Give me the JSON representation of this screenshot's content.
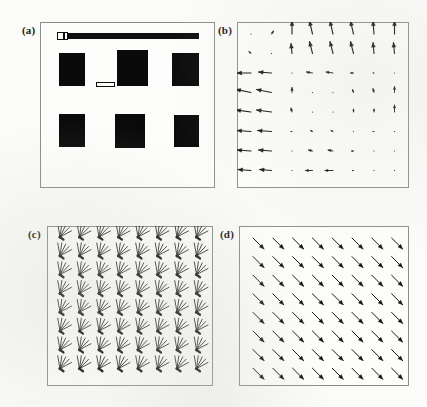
{
  "figure": {
    "width": 427,
    "height": 407,
    "background": "#fbfbf9",
    "ink_color": "#141414",
    "frame_color": "#8d8d8a"
  },
  "panels": [
    {
      "id": "a",
      "label": "(a)",
      "kind": "image",
      "caption_position": "top-left-outside",
      "frame": {
        "x": 40,
        "y": 22,
        "w": 175,
        "h": 166
      },
      "label_pos": {
        "x": 22,
        "y": 24
      },
      "content": {
        "description": "binary image of six dark rectangles in a 2x3 arrangement with a horizontal bar across the top",
        "top_bar": {
          "x": 17,
          "y": 11,
          "w": 142,
          "h": 6,
          "color": "#0f0f0f"
        },
        "top_bar_cap": {
          "x": 17,
          "y": 10,
          "w": 11,
          "h": 8
        },
        "top_bar_cap_divider": {
          "x": 23,
          "y": 11,
          "w": 2,
          "h": 6
        },
        "scale_bar": {
          "x": 56,
          "y": 60,
          "w": 19,
          "h": 5
        },
        "boxes": [
          {
            "x": 19,
            "y": 31,
            "w": 26,
            "h": 33
          },
          {
            "x": 77,
            "y": 28,
            "w": 31,
            "h": 36
          },
          {
            "x": 132,
            "y": 31,
            "w": 27,
            "h": 33
          },
          {
            "x": 19,
            "y": 92,
            "w": 26,
            "h": 33
          },
          {
            "x": 75,
            "y": 92,
            "w": 30,
            "h": 34
          },
          {
            "x": 134,
            "y": 93,
            "w": 25,
            "h": 32
          }
        ]
      }
    },
    {
      "id": "b",
      "label": "(b)",
      "kind": "vector-field",
      "caption_position": "top-left-outside",
      "frame": {
        "x": 237,
        "y": 22,
        "w": 172,
        "h": 166
      },
      "label_pos": {
        "x": 218,
        "y": 24
      },
      "content": {
        "description": "sparse irregular vector field: strong upward vectors along the top rows, strong leftward vectors along the left columns, near-zero vectors elsewhere",
        "grid": {
          "cols": 8,
          "rows": 8,
          "x0": 14,
          "y0": 12,
          "dx": 20.5,
          "dy": 19.5
        },
        "vectors": [
          [
            {
              "dx": 0,
              "dy": 0,
              "mag": 0.0,
              "angle": 0
            },
            {
              "dx": 2,
              "dy": -3,
              "mag": 0.12,
              "angle": 56
            },
            {
              "dx": 0,
              "dy": -13,
              "mag": 0.82,
              "angle": 90
            },
            {
              "dx": -3,
              "dy": -13,
              "mag": 0.86,
              "angle": 103
            },
            {
              "dx": -3,
              "dy": -13,
              "mag": 0.86,
              "angle": 103
            },
            {
              "dx": -3,
              "dy": -13,
              "mag": 0.86,
              "angle": 103
            },
            {
              "dx": -1,
              "dy": -13,
              "mag": 0.82,
              "angle": 94
            },
            {
              "dx": 0,
              "dy": -13,
              "mag": 0.82,
              "angle": 90
            }
          ],
          [
            {
              "dx": -2,
              "dy": -2,
              "mag": 0.1,
              "angle": 135
            },
            {
              "dx": 0,
              "dy": 0,
              "mag": 0.0,
              "angle": 0
            },
            {
              "dx": -1,
              "dy": -10,
              "mag": 0.64,
              "angle": 96
            },
            {
              "dx": -3,
              "dy": -12,
              "mag": 0.8,
              "angle": 104
            },
            {
              "dx": -3,
              "dy": -12,
              "mag": 0.8,
              "angle": 104
            },
            {
              "dx": -3,
              "dy": -12,
              "mag": 0.8,
              "angle": 104
            },
            {
              "dx": -1,
              "dy": -11,
              "mag": 0.7,
              "angle": 95
            },
            {
              "dx": -1,
              "dy": -11,
              "mag": 0.7,
              "angle": 95
            }
          ],
          [
            {
              "dx": -14,
              "dy": 0,
              "mag": 0.88,
              "angle": 180
            },
            {
              "dx": -13,
              "dy": -1,
              "mag": 0.82,
              "angle": 184
            },
            {
              "dx": 0,
              "dy": 0,
              "mag": 0.0,
              "angle": 0
            },
            {
              "dx": -6,
              "dy": -1,
              "mag": 0.38,
              "angle": 189
            },
            {
              "dx": -7,
              "dy": -1,
              "mag": 0.44,
              "angle": 188
            },
            {
              "dx": -3,
              "dy": 0,
              "mag": 0.18,
              "angle": 180
            },
            {
              "dx": -1,
              "dy": 0,
              "mag": 0.06,
              "angle": 180
            },
            {
              "dx": 0,
              "dy": 0,
              "mag": 0.0,
              "angle": 0
            }
          ],
          [
            {
              "dx": -15,
              "dy": -3,
              "mag": 0.96,
              "angle": 191
            },
            {
              "dx": -15,
              "dy": -3,
              "mag": 0.96,
              "angle": 191
            },
            {
              "dx": 0,
              "dy": -5,
              "mag": 0.32,
              "angle": 90
            },
            {
              "dx": 0,
              "dy": 0,
              "mag": 0.0,
              "angle": 0
            },
            {
              "dx": 0,
              "dy": 0,
              "mag": 0.0,
              "angle": 0
            },
            {
              "dx": -1,
              "dy": -3,
              "mag": 0.18,
              "angle": 108
            },
            {
              "dx": -1,
              "dy": -4,
              "mag": 0.26,
              "angle": 104
            },
            {
              "dx": 0,
              "dy": -6,
              "mag": 0.38,
              "angle": 90
            }
          ],
          [
            {
              "dx": -15,
              "dy": -2,
              "mag": 0.94,
              "angle": 188
            },
            {
              "dx": -15,
              "dy": -2,
              "mag": 0.94,
              "angle": 188
            },
            {
              "dx": -1,
              "dy": -4,
              "mag": 0.26,
              "angle": 104
            },
            {
              "dx": 0,
              "dy": 0,
              "mag": 0.0,
              "angle": 0
            },
            {
              "dx": 0,
              "dy": 0,
              "mag": 0.0,
              "angle": 0
            },
            {
              "dx": 0,
              "dy": -3,
              "mag": 0.18,
              "angle": 90
            },
            {
              "dx": 0,
              "dy": -3,
              "mag": 0.18,
              "angle": 90
            },
            {
              "dx": 0,
              "dy": -7,
              "mag": 0.44,
              "angle": 90
            }
          ],
          [
            {
              "dx": -14,
              "dy": -1,
              "mag": 0.88,
              "angle": 184
            },
            {
              "dx": -14,
              "dy": -1,
              "mag": 0.88,
              "angle": 184
            },
            {
              "dx": -1,
              "dy": 0,
              "mag": 0.08,
              "angle": 180
            },
            {
              "dx": -2,
              "dy": -1,
              "mag": 0.14,
              "angle": 197
            },
            {
              "dx": -2,
              "dy": -1,
              "mag": 0.14,
              "angle": 197
            },
            {
              "dx": 0,
              "dy": 0,
              "mag": 0.0,
              "angle": 0
            },
            {
              "dx": -1,
              "dy": 0,
              "mag": 0.06,
              "angle": 180
            },
            {
              "dx": 0,
              "dy": 0,
              "mag": 0.04,
              "angle": 0
            }
          ],
          [
            {
              "dx": -14,
              "dy": -1,
              "mag": 0.88,
              "angle": 184
            },
            {
              "dx": -13,
              "dy": -1,
              "mag": 0.82,
              "angle": 184
            },
            {
              "dx": 0,
              "dy": 0,
              "mag": 0.0,
              "angle": 0
            },
            {
              "dx": -4,
              "dy": -1,
              "mag": 0.26,
              "angle": 194
            },
            {
              "dx": -5,
              "dy": -1,
              "mag": 0.32,
              "angle": 191
            },
            {
              "dx": -2,
              "dy": 0,
              "mag": 0.12,
              "angle": 180
            },
            {
              "dx": 0,
              "dy": 0,
              "mag": 0.0,
              "angle": 0
            },
            {
              "dx": 0,
              "dy": 0,
              "mag": 0.0,
              "angle": 0
            }
          ],
          [
            {
              "dx": -13,
              "dy": -1,
              "mag": 0.82,
              "angle": 184
            },
            {
              "dx": -12,
              "dy": -1,
              "mag": 0.76,
              "angle": 185
            },
            {
              "dx": 0,
              "dy": 0,
              "mag": 0.0,
              "angle": 0
            },
            {
              "dx": -7,
              "dy": 0,
              "mag": 0.44,
              "angle": 180
            },
            {
              "dx": -8,
              "dy": 0,
              "mag": 0.5,
              "angle": 180
            },
            {
              "dx": -1,
              "dy": 0,
              "mag": 0.06,
              "angle": 180
            },
            {
              "dx": 0,
              "dy": 0,
              "mag": 0.0,
              "angle": 0
            },
            {
              "dx": 0,
              "dy": 0,
              "mag": 0.0,
              "angle": 0
            }
          ]
        ]
      }
    },
    {
      "id": "c",
      "label": "(c)",
      "kind": "fan-field",
      "caption_position": "top-left-outside",
      "frame": {
        "x": 47,
        "y": 226,
        "w": 166,
        "h": 160
      },
      "label_pos": {
        "x": 28,
        "y": 228
      },
      "content": {
        "description": "regular 8x8 grid of multi-line fan glyphs; each glyph is a bundle of five rays converging at the upper-left apex, spanning directions between up and down-right",
        "grid": {
          "cols": 8,
          "rows": 8,
          "x0": 13,
          "y0": 11,
          "dx": 19.5,
          "dy": 18.8
        },
        "glyph": {
          "ray_count": 5,
          "ray_angles_deg": [
            208,
            226,
            244,
            262,
            280
          ],
          "ray_length": 13,
          "apex_dot_radius": 1.6
        }
      }
    },
    {
      "id": "d",
      "label": "(d)",
      "kind": "vector-field",
      "caption_position": "top-left-outside",
      "frame": {
        "x": 239,
        "y": 226,
        "w": 170,
        "h": 160
      },
      "label_pos": {
        "x": 220,
        "y": 228
      },
      "content": {
        "description": "uniform 8x8 grid of equal-length arrows all pointing down and to the right at about minus forty-five degrees",
        "grid": {
          "cols": 8,
          "rows": 8,
          "x0": 14,
          "y0": 12,
          "dx": 19.8,
          "dy": 18.6
        },
        "uniform_vector": {
          "dx": 11,
          "dy": 11,
          "angle_deg": -45,
          "magnitude": 1.0
        },
        "arrow_head_length": 5
      }
    }
  ]
}
